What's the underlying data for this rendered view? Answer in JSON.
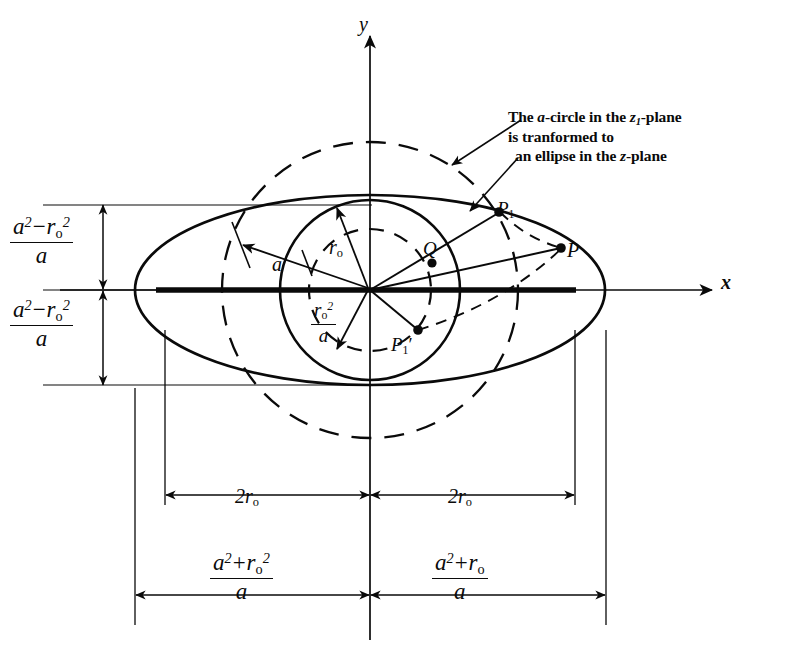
{
  "figure": {
    "axes": {
      "y_label": "y",
      "x_label": "x"
    },
    "annotation": {
      "line1_pre": "The ",
      "line1_a": "a",
      "line1_mid": "-circle in the ",
      "line1_z": "z",
      "line1_z_sub": "1",
      "line1_post": "-plane",
      "line2": "is tranformed to",
      "line3_pre": "an ellipse in the ",
      "line3_z": "z",
      "line3_post": "-plane"
    },
    "point_labels": {
      "Q": "Q",
      "P": "P",
      "P1": "P",
      "P1_sub": "1",
      "P1prime": "P",
      "P1prime_sub": "1",
      "P1prime_mark": "′"
    },
    "radius_labels": {
      "a": "a",
      "r0": "r",
      "r0_sub": "o"
    },
    "inner_fraction": {
      "num_var": "r",
      "num_sub": "o",
      "num_sup": "2",
      "den": "a"
    },
    "vertical_dimension": {
      "num_a": "a",
      "num_a_sup": "2",
      "num_op": "−",
      "num_r": "r",
      "num_r_sub": "o",
      "num_r_sup": "2",
      "den": "a"
    },
    "horizontal_dimensions": {
      "half_width_inner_left": "2r",
      "half_width_inner_left_sub": "o",
      "half_width_inner_right": "2r",
      "half_width_inner_right_sub": "o",
      "outer_left": {
        "num_a": "a",
        "num_a_sup": "2",
        "num_op": "+",
        "num_r": "r",
        "num_r_sub": "o",
        "num_r_sup": "2",
        "den": "a"
      },
      "outer_right": {
        "num_a": "a",
        "num_a_sup": "2",
        "num_op": "+",
        "num_r": "r",
        "num_r_sub": "o",
        "num_r_sup": "",
        "den": "a"
      }
    },
    "colors": {
      "ink": "#0a0a0a",
      "background": "#ffffff"
    }
  }
}
